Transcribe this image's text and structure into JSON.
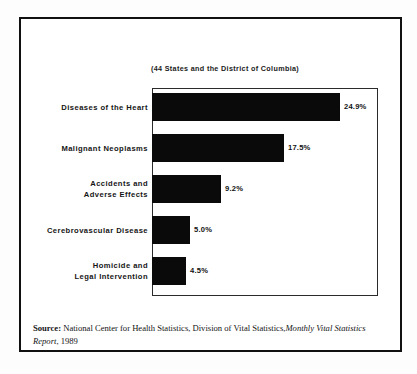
{
  "chart_data": {
    "type": "bar",
    "orientation": "horizontal",
    "title": "",
    "subtitle": "(44 States and the District of Columbia)",
    "categories": [
      "Diseases of the Heart",
      "Malignant Neoplasms",
      "Accidents and\nAdverse Effects",
      "Cerebrovascular Disease",
      "Homicide and\nLegal Intervention"
    ],
    "values": [
      24.9,
      17.5,
      9.2,
      5.0,
      4.5
    ],
    "value_labels": [
      "24.9%",
      "17.5%",
      "9.2%",
      "5.0%",
      "4.5%"
    ],
    "xlabel": "",
    "ylabel": "",
    "xlim": [
      0,
      30
    ],
    "grid": false,
    "legend": "none",
    "bar_color": "#0a0a0a",
    "frame_color": "#2b2b2b"
  },
  "source_note": {
    "label": "Source:",
    "text_before": "National Center for Health Statistics, Division of Vital Statistics,",
    "publication": "Monthly Vital Statistics Report",
    "text_after": ", 1989"
  }
}
